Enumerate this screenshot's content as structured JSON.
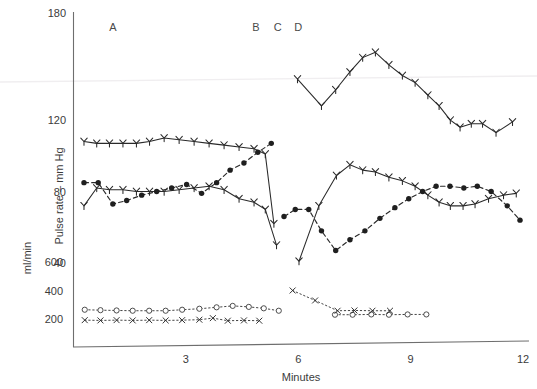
{
  "chart_data": {
    "type": "line",
    "title": "",
    "xlabel": "Minutes",
    "ylabel_primary": "Pulse rate – mm Hg",
    "ylabel_secondary": "ml/min",
    "xlim": [
      0,
      12
    ],
    "xticks": [
      3,
      6,
      9,
      12
    ],
    "xticklabels": [
      "3",
      "6",
      "9",
      "12"
    ],
    "yticks_primary": [
      40,
      80,
      120,
      180
    ],
    "yticklabels_primary": [
      "40",
      "80",
      "120",
      "180"
    ],
    "ylim_primary": [
      20,
      180
    ],
    "yticks_secondary": [
      200,
      400,
      600
    ],
    "yticklabels_secondary": [
      "200",
      "400",
      "600"
    ],
    "ylim_secondary": [
      0,
      1000
    ],
    "grid": false,
    "legend": "none",
    "annotations": [
      {
        "label": "A",
        "x": 1.05,
        "y": 170
      },
      {
        "label": "B",
        "x": 4.87,
        "y": 170
      },
      {
        "label": "C",
        "x": 5.45,
        "y": 170
      },
      {
        "label": "D",
        "x": 6.0,
        "y": 170
      }
    ],
    "series": [
      {
        "name": "Systolic blood pressure",
        "axis": "primary",
        "marker": "arrow",
        "linestyle": "solid",
        "segments": [
          {
            "x": [
              0.28,
              0.62,
              0.96,
              1.32,
              1.68,
              2.03,
              2.42,
              2.82,
              3.22,
              3.62,
              4.02,
              4.42,
              4.82,
              5.12,
              5.35
            ],
            "y": [
              108,
              107,
              107,
              107,
              107,
              108,
              110,
              109,
              108,
              107,
              106,
              105,
              104,
              101,
              62
            ]
          },
          {
            "x": [
              5.98,
              6.62,
              7.0,
              7.38,
              7.72,
              8.06,
              8.42,
              8.78,
              9.12,
              9.46,
              9.76,
              10.06,
              10.32,
              10.62,
              10.92,
              11.28,
              11.72
            ],
            "y": [
              143,
              128,
              137,
              147,
              155,
              158,
              151,
              145,
              141,
              134,
              128,
              120,
              116,
              118,
              118,
              113,
              119
            ]
          }
        ]
      },
      {
        "name": "Diastolic blood pressure",
        "axis": "primary",
        "marker": "arrow",
        "linestyle": "solid",
        "segments": [
          {
            "x": [
              0.28,
              0.62,
              0.96,
              1.32,
              1.68,
              2.03,
              2.42,
              2.82,
              3.22,
              3.62,
              4.02,
              4.42,
              4.82,
              5.12,
              5.42
            ],
            "y": [
              72,
              82,
              81,
              81,
              80,
              80,
              80,
              81,
              82,
              83,
              81,
              76,
              74,
              70,
              50
            ]
          },
          {
            "x": [
              6.02,
              6.55,
              7.02,
              7.38,
              7.72,
              8.06,
              8.42,
              8.78,
              9.12,
              9.46,
              9.76,
              10.06,
              10.4,
              10.72,
              11.08,
              11.48,
              11.82
            ],
            "y": [
              41,
              72,
              89,
              95,
              92,
              91,
              88,
              86,
              83,
              78,
              74,
              72,
              72,
              73,
              76,
              78,
              79
            ]
          }
        ]
      },
      {
        "name": "Mean arterial pressure",
        "axis": "primary",
        "marker": "dot",
        "linestyle": "dashed",
        "segments": [
          {
            "x": [
              0.28,
              0.66,
              1.05,
              1.42,
              1.82,
              2.22,
              2.62,
              3.02,
              3.42,
              3.82,
              4.18,
              4.55,
              4.92,
              5.28
            ],
            "y": [
              85,
              85,
              73,
              75,
              78,
              80,
              82,
              84,
              79,
              85,
              92,
              96,
              102,
              107
            ]
          },
          {
            "x": [
              5.62,
              5.92,
              6.28,
              6.62,
              7.0,
              7.38,
              7.78,
              8.18,
              8.58,
              8.95,
              9.32,
              9.68,
              10.05,
              10.42,
              10.78,
              11.15,
              11.58,
              11.92
            ],
            "y": [
              66,
              70,
              70,
              58,
              47,
              53,
              58,
              65,
              71,
              76,
              80,
              83,
              83,
              82,
              83,
              80,
              72,
              64
            ]
          }
        ]
      },
      {
        "name": "Cardiac output (open circles)",
        "axis": "secondary",
        "marker": "open-circle",
        "linestyle": "dotted",
        "segments": [
          {
            "x": [
              0.3,
              0.72,
              1.15,
              1.58,
              2.02,
              2.46,
              2.9,
              3.36,
              3.82,
              4.25,
              4.68,
              5.08,
              5.48
            ],
            "y": [
              265,
              262,
              260,
              258,
              258,
              258,
              265,
              272,
              282,
              292,
              285,
              275,
              258
            ]
          },
          {
            "x": [
              6.98,
              7.45,
              7.95,
              8.42,
              8.92,
              9.42
            ],
            "y": [
              230,
              230,
              232,
              230,
              232,
              232
            ]
          }
        ]
      },
      {
        "name": "Renal blood flow (x markers)",
        "axis": "secondary",
        "marker": "x",
        "linestyle": "dotted",
        "segments": [
          {
            "x": [
              0.3,
              0.72,
              1.15,
              1.58,
              2.02,
              2.46,
              2.9,
              3.36,
              3.72,
              4.12,
              4.55,
              4.96
            ],
            "y": [
              192,
              190,
              192,
              190,
              192,
              190,
              192,
              195,
              206,
              188,
              190,
              188
            ]
          },
          {
            "x": [
              5.85,
              6.45,
              7.05,
              7.5,
              7.98,
              8.45
            ],
            "y": [
              400,
              330,
              258,
              260,
              258,
              258
            ]
          }
        ]
      }
    ]
  },
  "axes": {
    "x_title": "Minutes",
    "y_primary_title": "Pulse rate – mm Hg",
    "y_secondary_title": "ml/min"
  }
}
